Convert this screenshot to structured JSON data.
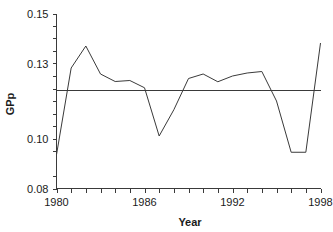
{
  "chart_data": {
    "type": "line",
    "title": "",
    "xlabel": "Year",
    "ylabel": "GPp",
    "xlim": [
      1980,
      1998
    ],
    "ylim": [
      0.08,
      0.15
    ],
    "grid": false,
    "legend": null,
    "x_ticks_labeled": [
      "1980",
      "1986",
      "1992",
      "1998"
    ],
    "x_tick_values": [
      1980,
      1986,
      1992,
      1998
    ],
    "x_minor_tick_values": [
      1981,
      1982,
      1983,
      1984,
      1985,
      1987,
      1988,
      1989,
      1990,
      1991,
      1993,
      1994,
      1995,
      1996,
      1997
    ],
    "y_ticks_labeled": [
      "0.15",
      "0.13",
      "0.10",
      "0.08"
    ],
    "y_tick_values": [
      0.15,
      0.13,
      0.1,
      0.08
    ],
    "y_minor_tick_values": [
      0.145,
      0.14,
      0.135,
      0.125,
      0.12,
      0.115,
      0.11,
      0.105,
      0.095,
      0.085
    ],
    "x": [
      1980,
      1981,
      1982,
      1983,
      1984,
      1985,
      1986,
      1987,
      1988,
      1989,
      1990,
      1991,
      1992,
      1993,
      1994,
      1995,
      1996,
      1997,
      1998
    ],
    "series": [
      {
        "name": "GPp",
        "kind": "line",
        "color": "#3a3a3a",
        "values": [
          0.0935,
          0.1282,
          0.137,
          0.1258,
          0.1228,
          0.1232,
          0.1203,
          0.101,
          0.1115,
          0.124,
          0.1258,
          0.1227,
          0.125,
          0.1262,
          0.1268,
          0.115,
          0.0945,
          0.0945,
          0.1382
        ]
      },
      {
        "name": "mean trend",
        "kind": "horizontal-line",
        "color": "#3a3a3a",
        "value": 0.1192
      }
    ],
    "annotations": []
  },
  "axes": {
    "y_axis_title": "GPp",
    "x_axis_title": "Year"
  },
  "ghost_title": ""
}
